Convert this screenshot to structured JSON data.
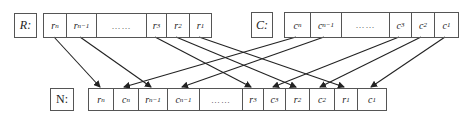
{
  "top_left": {
    "label": "R:",
    "cells": [
      {
        "base": "r",
        "sub": "n"
      },
      {
        "base": "r",
        "sub": "n−1"
      },
      {
        "base": "……",
        "sub": ""
      },
      {
        "base": "r",
        "sub": "3"
      },
      {
        "base": "r",
        "sub": "2"
      },
      {
        "base": "r",
        "sub": "1"
      }
    ]
  },
  "top_right": {
    "label": "C:",
    "cells": [
      {
        "base": "c",
        "sub": "n"
      },
      {
        "base": "c",
        "sub": "n−1"
      },
      {
        "base": "……",
        "sub": ""
      },
      {
        "base": "c",
        "sub": "3"
      },
      {
        "base": "c",
        "sub": "2"
      },
      {
        "base": "c",
        "sub": "1"
      }
    ]
  },
  "bottom": {
    "label": "N:",
    "cells": [
      {
        "base": "r",
        "sub": "n"
      },
      {
        "base": "c",
        "sub": "n"
      },
      {
        "base": "r",
        "sub": "n−1"
      },
      {
        "base": "c",
        "sub": "n−1"
      },
      {
        "base": "……",
        "sub": ""
      },
      {
        "base": "r",
        "sub": "3"
      },
      {
        "base": "c",
        "sub": "3"
      },
      {
        "base": "r",
        "sub": "2"
      },
      {
        "base": "c",
        "sub": "2"
      },
      {
        "base": "r",
        "sub": "1"
      },
      {
        "base": "c",
        "sub": "1"
      }
    ]
  },
  "arrows": [
    {
      "from": "R.r_n",
      "to": "N.r_n"
    },
    {
      "from": "R.r_n-1",
      "to": "N.r_n-1"
    },
    {
      "from": "R.r_3",
      "to": "N.r_3"
    },
    {
      "from": "R.r_2",
      "to": "N.r_2"
    },
    {
      "from": "R.r_1",
      "to": "N.r_1"
    },
    {
      "from": "C.c_n",
      "to": "N.c_n"
    },
    {
      "from": "C.c_n-1",
      "to": "N.c_n-1"
    },
    {
      "from": "C.c_3",
      "to": "N.c_3"
    },
    {
      "from": "C.c_2",
      "to": "N.c_2"
    },
    {
      "from": "C.c_1",
      "to": "N.c_1"
    }
  ],
  "colors": {
    "line": "#222222",
    "border": "#555555"
  }
}
